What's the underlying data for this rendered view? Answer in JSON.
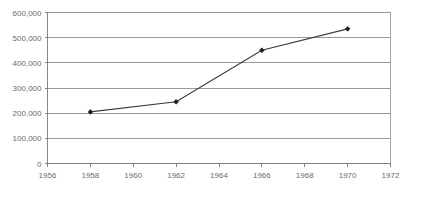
{
  "chart_data": {
    "type": "line",
    "title": "",
    "subtitle": "",
    "xlabel": "",
    "ylabel": "",
    "x": [
      1958,
      1962,
      1966,
      1970
    ],
    "values": [
      205000,
      245000,
      450000,
      535000
    ],
    "series": [
      {
        "name": "",
        "x": [
          1958,
          1962,
          1966,
          1970
        ],
        "values": [
          205000,
          245000,
          450000,
          535000
        ]
      }
    ],
    "xlim": [
      1956,
      1972
    ],
    "ylim": [
      0,
      600000
    ],
    "x_ticks": [
      1956,
      1958,
      1960,
      1962,
      1964,
      1966,
      1968,
      1970,
      1972
    ],
    "y_ticks": [
      0,
      100000,
      200000,
      300000,
      400000,
      500000,
      600000
    ],
    "x_tick_labels": [
      "1956",
      "1958",
      "1960",
      "1962",
      "1964",
      "1966",
      "1968",
      "1970",
      "1972"
    ],
    "y_tick_labels": [
      "0",
      "100,000",
      "200,000",
      "300,000",
      "400,000",
      "500,000",
      "600,000"
    ],
    "grid": "horizontal",
    "legend": "none",
    "marker": "diamond",
    "annotations": [],
    "colors": {
      "line": "#3a3a3a",
      "marker": "#1a1a1a",
      "grid": "#808080",
      "frame": "#9a9a9a",
      "tick_text": "#6b6b6b",
      "background": "#ffffff"
    }
  },
  "axes": {
    "y": {
      "labels": [
        {
          "text": "600,000",
          "value": 600000
        },
        {
          "text": "500,000",
          "value": 500000
        },
        {
          "text": "400,000",
          "value": 400000
        },
        {
          "text": "300,000",
          "value": 300000
        },
        {
          "text": "200,000",
          "value": 200000
        },
        {
          "text": "100,000",
          "value": 100000
        },
        {
          "text": "0",
          "value": 0
        }
      ]
    },
    "x": {
      "labels": [
        {
          "text": "1956",
          "value": 1956
        },
        {
          "text": "1958",
          "value": 1958
        },
        {
          "text": "1960",
          "value": 1960
        },
        {
          "text": "1962",
          "value": 1962
        },
        {
          "text": "1964",
          "value": 1964
        },
        {
          "text": "1966",
          "value": 1966
        },
        {
          "text": "1968",
          "value": 1968
        },
        {
          "text": "1970",
          "value": 1970
        },
        {
          "text": "1972",
          "value": 1972
        }
      ]
    }
  },
  "points": [
    {
      "x": 1958,
      "y": 205000
    },
    {
      "x": 1962,
      "y": 245000
    },
    {
      "x": 1966,
      "y": 450000
    },
    {
      "x": 1970,
      "y": 535000
    }
  ]
}
